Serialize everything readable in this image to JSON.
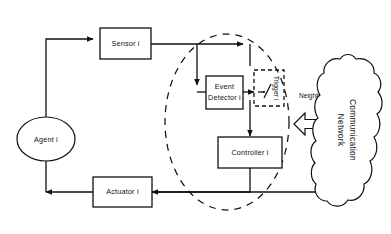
{
  "diagram": {
    "nodes": {
      "agent": {
        "label": "Agent i",
        "shape": "ellipse"
      },
      "sensor": {
        "label": "Sensor i",
        "shape": "rectangle"
      },
      "event_detector": {
        "label_line1": "Event",
        "label_line2": "Detector i",
        "shape": "rectangle"
      },
      "trigger": {
        "label": "Trigger i",
        "shape": "dashed-rectangle",
        "symbol": "switch"
      },
      "controller": {
        "label": "Controller i",
        "shape": "rectangle"
      },
      "actuator": {
        "label": "Actuator i",
        "shape": "rectangle"
      },
      "communication_network": {
        "label_line1": "Communication",
        "label_line2": "Network",
        "shape": "cloud"
      }
    },
    "labels": {
      "neighbors": "Neighbors"
    },
    "boundary": {
      "name": "event-triggered-mechanism-boundary",
      "style": "dashed-ellipse"
    },
    "connectors": [
      {
        "from": "agent",
        "to": "sensor",
        "type": "arrow"
      },
      {
        "from": "sensor",
        "to": "event_detector",
        "type": "arrow"
      },
      {
        "from": "sensor",
        "to": "trigger",
        "type": "arrow"
      },
      {
        "from": "event_detector",
        "to": "trigger",
        "type": "arrow"
      },
      {
        "from": "trigger",
        "to": "controller",
        "type": "arrow"
      },
      {
        "from": "controller",
        "to": "actuator",
        "type": "arrow"
      },
      {
        "from": "actuator",
        "to": "agent",
        "type": "arrow"
      },
      {
        "from": "communication_network",
        "to": "actuator",
        "type": "arrow"
      },
      {
        "from": "agent_block",
        "to": "communication_network",
        "type": "bidirectional-block-arrow"
      }
    ],
    "colors": {
      "stroke": "#111111",
      "background": "#ffffff",
      "fill": "#ffffff"
    }
  }
}
